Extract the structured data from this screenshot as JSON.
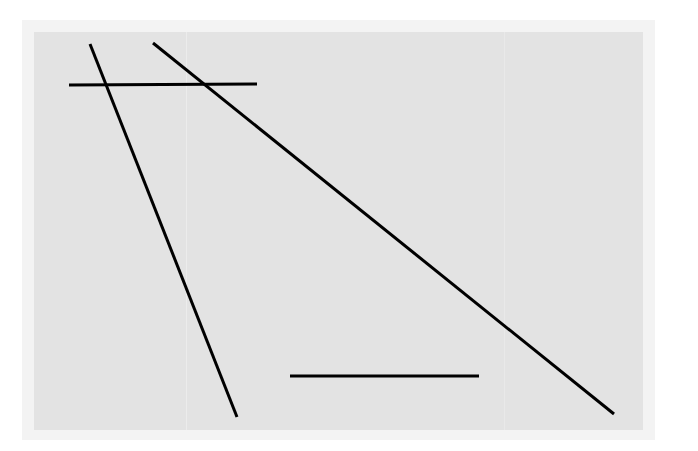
{
  "figure": {
    "background_color": "#e3e3e3",
    "line_color": "#000000",
    "line_width": 3,
    "segments": [
      {
        "id": "diagonal-left",
        "x1": 90,
        "y1": 44,
        "x2": 237,
        "y2": 417
      },
      {
        "id": "diagonal-right",
        "x1": 153,
        "y1": 43,
        "x2": 614,
        "y2": 414
      },
      {
        "id": "horizontal-top",
        "x1": 69,
        "y1": 85,
        "x2": 257,
        "y2": 84
      },
      {
        "id": "horizontal-bottom",
        "x1": 290,
        "y1": 376,
        "x2": 479,
        "y2": 376
      }
    ]
  }
}
